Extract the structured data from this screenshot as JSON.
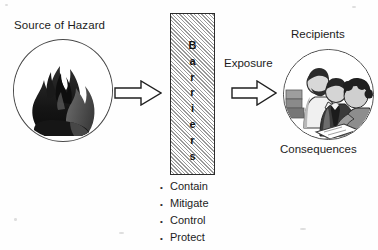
{
  "diagram": {
    "title_source": "Source of Hazard",
    "title_recipients": "Recipients",
    "title_consequences": "Consequences",
    "label_exposure": "Exposure",
    "barriers_word": "Barriers",
    "barrier_letters": [
      "B",
      "a",
      "r",
      "r",
      "i",
      "e",
      "r",
      "s"
    ],
    "bullet_glyph": "•",
    "barrier_actions": [
      "Contain",
      "Mitigate",
      "Control",
      "Protect"
    ],
    "colors": {
      "ink": "#1c1c1c",
      "outline": "#4a4a4a",
      "hatch_light": "#ffffff",
      "hatch_dark": "#9a9a9a",
      "background": "#fefefe"
    },
    "icons": {
      "hazard": "flame-icon",
      "recipients": "people-group-icon",
      "arrow_one": "block-arrow-right-icon",
      "arrow_two": "block-arrow-right-icon"
    }
  }
}
